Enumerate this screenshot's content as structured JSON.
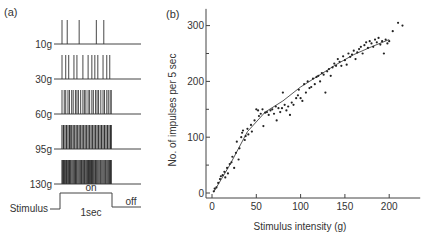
{
  "panel_a": {
    "label": "(a)",
    "trains": [
      {
        "label": "10g",
        "spikes": [
          0.0,
          0.07,
          0.23,
          0.46,
          0.56
        ]
      },
      {
        "label": "30g",
        "spikes": [
          0.0,
          0.05,
          0.09,
          0.16,
          0.2,
          0.28,
          0.35,
          0.4,
          0.44,
          0.48,
          0.55,
          0.6,
          0.64
        ]
      },
      {
        "label": "60g",
        "spikes": [
          0.0,
          0.03,
          0.05,
          0.08,
          0.1,
          0.13,
          0.15,
          0.18,
          0.2,
          0.22,
          0.25,
          0.28,
          0.3,
          0.32,
          0.35,
          0.37,
          0.4,
          0.42,
          0.45,
          0.47,
          0.49,
          0.52,
          0.55,
          0.57,
          0.6,
          0.62,
          0.645,
          0.66
        ]
      },
      {
        "label": "95g",
        "spikes": [
          0.0,
          0.02,
          0.04,
          0.06,
          0.08,
          0.1,
          0.11,
          0.13,
          0.15,
          0.17,
          0.19,
          0.21,
          0.23,
          0.25,
          0.27,
          0.29,
          0.31,
          0.33,
          0.35,
          0.37,
          0.39,
          0.41,
          0.43,
          0.45,
          0.47,
          0.49,
          0.51,
          0.53,
          0.55,
          0.57,
          0.59,
          0.61,
          0.63,
          0.65,
          0.66
        ]
      },
      {
        "label": "130g",
        "spikes": [
          0.0,
          0.01,
          0.02,
          0.035,
          0.05,
          0.06,
          0.07,
          0.085,
          0.1,
          0.11,
          0.12,
          0.135,
          0.15,
          0.165,
          0.18,
          0.19,
          0.2,
          0.215,
          0.23,
          0.245,
          0.26,
          0.27,
          0.285,
          0.3,
          0.31,
          0.325,
          0.34,
          0.355,
          0.37,
          0.38,
          0.395,
          0.41,
          0.425,
          0.44,
          0.45,
          0.465,
          0.48,
          0.495,
          0.51,
          0.52,
          0.535,
          0.55,
          0.565,
          0.58,
          0.59,
          0.605,
          0.62,
          0.635,
          0.65,
          0.66
        ]
      }
    ],
    "stimulus_label": "Stimulus",
    "on_label": "on",
    "off_label": "off",
    "duration_label": "1sec",
    "on_fraction": 0.67
  },
  "chart_data": {
    "type": "scatter",
    "panel_label": "(b)",
    "title": "",
    "xlabel": "Stimulus intensity (g)",
    "ylabel": "No. of impulses per 5 sec",
    "xlim": [
      0,
      235
    ],
    "ylim": [
      0,
      330
    ],
    "xticks": [
      0,
      50,
      100,
      150,
      200
    ],
    "yticks": [
      0,
      100,
      200,
      300
    ],
    "yminor": [
      50,
      150,
      250
    ],
    "grid": false,
    "points": [
      [
        2,
        3
      ],
      [
        3,
        8
      ],
      [
        5,
        10
      ],
      [
        7,
        18
      ],
      [
        9,
        25
      ],
      [
        10,
        30
      ],
      [
        12,
        32
      ],
      [
        14,
        38
      ],
      [
        15,
        28
      ],
      [
        17,
        45
      ],
      [
        18,
        35
      ],
      [
        20,
        52
      ],
      [
        22,
        55
      ],
      [
        23,
        65
      ],
      [
        25,
        45
      ],
      [
        27,
        72
      ],
      [
        28,
        92
      ],
      [
        30,
        60
      ],
      [
        31,
        80
      ],
      [
        33,
        100
      ],
      [
        34,
        108
      ],
      [
        35,
        112
      ],
      [
        37,
        95
      ],
      [
        38,
        102
      ],
      [
        40,
        115
      ],
      [
        41,
        105
      ],
      [
        44,
        122
      ],
      [
        45,
        110
      ],
      [
        48,
        130
      ],
      [
        50,
        150
      ],
      [
        52,
        148
      ],
      [
        53,
        138
      ],
      [
        55,
        142
      ],
      [
        57,
        150
      ],
      [
        58,
        120
      ],
      [
        60,
        144
      ],
      [
        62,
        145
      ],
      [
        64,
        140
      ],
      [
        66,
        148
      ],
      [
        68,
        150
      ],
      [
        70,
        142
      ],
      [
        72,
        155
      ],
      [
        73,
        130
      ],
      [
        75,
        152
      ],
      [
        77,
        145
      ],
      [
        79,
        152
      ],
      [
        80,
        180
      ],
      [
        82,
        158
      ],
      [
        84,
        148
      ],
      [
        86,
        155
      ],
      [
        88,
        140
      ],
      [
        90,
        162
      ],
      [
        92,
        158
      ],
      [
        95,
        170
      ],
      [
        97,
        175
      ],
      [
        98,
        185
      ],
      [
        100,
        170
      ],
      [
        102,
        165
      ],
      [
        104,
        195
      ],
      [
        106,
        180
      ],
      [
        108,
        200
      ],
      [
        110,
        188
      ],
      [
        112,
        190
      ],
      [
        114,
        205
      ],
      [
        116,
        195
      ],
      [
        118,
        208
      ],
      [
        120,
        210
      ],
      [
        122,
        200
      ],
      [
        124,
        215
      ],
      [
        126,
        212
      ],
      [
        128,
        180
      ],
      [
        130,
        218
      ],
      [
        132,
        222
      ],
      [
        134,
        210
      ],
      [
        136,
        225
      ],
      [
        138,
        232
      ],
      [
        140,
        228
      ],
      [
        142,
        240
      ],
      [
        144,
        235
      ],
      [
        146,
        228
      ],
      [
        148,
        245
      ],
      [
        150,
        238
      ],
      [
        152,
        230
      ],
      [
        154,
        250
      ],
      [
        156,
        244
      ],
      [
        158,
        248
      ],
      [
        160,
        255
      ],
      [
        162,
        240
      ],
      [
        164,
        252
      ],
      [
        166,
        258
      ],
      [
        168,
        262
      ],
      [
        170,
        250
      ],
      [
        172,
        265
      ],
      [
        174,
        270
      ],
      [
        176,
        260
      ],
      [
        178,
        272
      ],
      [
        180,
        268
      ],
      [
        182,
        262
      ],
      [
        184,
        275
      ],
      [
        186,
        270
      ],
      [
        188,
        278
      ],
      [
        190,
        266
      ],
      [
        192,
        272
      ],
      [
        194,
        250
      ],
      [
        196,
        275
      ],
      [
        198,
        268
      ],
      [
        200,
        272
      ],
      [
        204,
        290
      ],
      [
        210,
        305
      ],
      [
        215,
        300
      ]
    ],
    "fit_line": [
      [
        2,
        2
      ],
      [
        20,
        50
      ],
      [
        40,
        110
      ],
      [
        60,
        145
      ],
      [
        80,
        165
      ],
      [
        100,
        190
      ],
      [
        120,
        210
      ],
      [
        140,
        230
      ],
      [
        160,
        248
      ],
      [
        180,
        262
      ],
      [
        200,
        275
      ]
    ]
  }
}
